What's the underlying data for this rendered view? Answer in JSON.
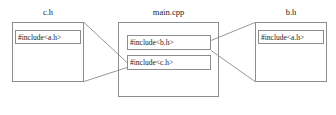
{
  "diagram": {
    "stroke_color": "#8d8d8d",
    "text_color": "#1a1a1a",
    "background_color": "#ffffff",
    "files": [
      {
        "id": "c_h",
        "title": "c.h",
        "includes": [
          {
            "id": "c_h_inc_a",
            "label": "#include<a.h>"
          }
        ]
      },
      {
        "id": "main_cpp",
        "title": "main.cpp",
        "includes": [
          {
            "id": "main_inc_b",
            "label": "#include<b.h>"
          },
          {
            "id": "main_inc_c",
            "label": "#include<c.h>"
          }
        ]
      },
      {
        "id": "b_h",
        "title": "b.h",
        "includes": [
          {
            "id": "b_h_inc_a",
            "label": "#include<a.h>"
          }
        ]
      }
    ],
    "connectors": [
      {
        "id": "conn-main-c-to-ch",
        "from": "main_inc_c",
        "to": "c_h"
      },
      {
        "id": "conn-main-b-to-bh",
        "from": "main_inc_b",
        "to": "b_h"
      }
    ]
  }
}
